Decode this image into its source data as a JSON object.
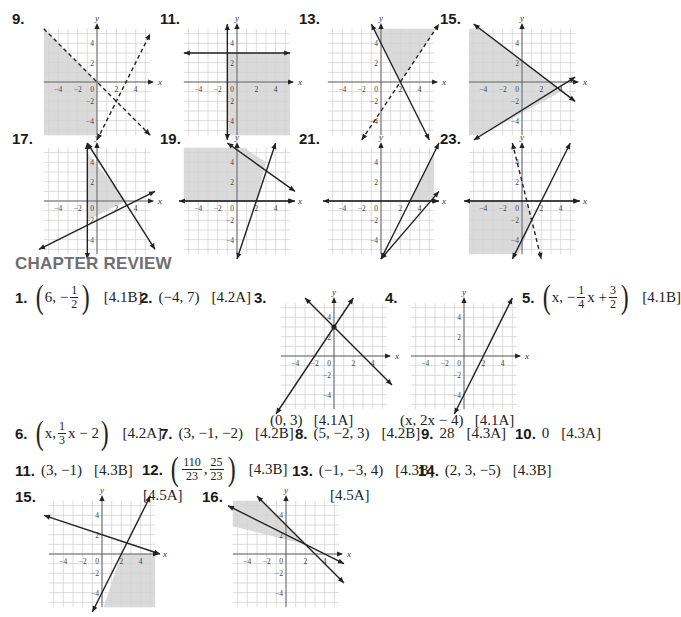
{
  "section_heading": "CHAPTER REVIEW",
  "colors": {
    "shade": "#d4d4d4",
    "grid": "#cfcfcf",
    "axis": "#555555",
    "line": "#222222",
    "heading": "#6d6f72"
  },
  "graphs_top": [
    {
      "id": "9",
      "label": "9.",
      "xlab": "x",
      "ylab": "y",
      "lines": [
        {
          "p1": [
            -5.5,
            5.5
          ],
          "p2": [
            5.5,
            -5.5
          ],
          "dashed": true,
          "arrows": [
            false,
            true
          ]
        },
        {
          "p1": [
            0,
            -6
          ],
          "p2": [
            5.5,
            5
          ],
          "dashed": true,
          "arrows": [
            true,
            true
          ]
        }
      ],
      "shade": [
        [
          -5.5,
          5.5
        ],
        [
          0,
          0
        ],
        [
          0,
          -6
        ],
        [
          -5.5,
          -6
        ]
      ]
    },
    {
      "id": "11",
      "label": "11.",
      "xlab": "x",
      "ylab": "y",
      "lines": [
        {
          "p1": [
            -5.5,
            3
          ],
          "p2": [
            5.5,
            3
          ],
          "dashed": false,
          "arrows": [
            true,
            true
          ]
        },
        {
          "p1": [
            -1,
            -6
          ],
          "p2": [
            -1,
            6
          ],
          "dashed": false,
          "arrows": [
            true,
            true
          ]
        }
      ],
      "shade": [
        [
          -1,
          3
        ],
        [
          5.5,
          3
        ],
        [
          5.5,
          -6
        ],
        [
          -1,
          -6
        ]
      ]
    },
    {
      "id": "13",
      "label": "13.",
      "xlab": "x",
      "ylab": "y",
      "lines": [
        {
          "p1": [
            -1,
            6
          ],
          "p2": [
            5,
            -6
          ],
          "dashed": false,
          "arrows": [
            true,
            true
          ]
        },
        {
          "p1": [
            -2,
            -6
          ],
          "p2": [
            6,
            6
          ],
          "dashed": true,
          "arrows": [
            true,
            true
          ]
        }
      ],
      "shade": [
        [
          -1,
          6
        ],
        [
          6,
          6
        ],
        [
          2,
          0
        ]
      ]
    },
    {
      "id": "15",
      "label": "15.",
      "xlab": "x",
      "ylab": "y",
      "lines": [
        {
          "p1": [
            -5,
            6
          ],
          "p2": [
            5.5,
            -2
          ],
          "dashed": false,
          "arrows": [
            true,
            true
          ]
        },
        {
          "p1": [
            -5,
            -6
          ],
          "p2": [
            5.5,
            0.5
          ],
          "dashed": false,
          "arrows": [
            true,
            true
          ]
        }
      ],
      "shade": [
        [
          -5.5,
          6
        ],
        [
          -5,
          6
        ],
        [
          4,
          -1
        ],
        [
          -5,
          -6
        ],
        [
          -5.5,
          -6
        ]
      ]
    },
    {
      "id": "17",
      "label": "17.",
      "xlab": "x",
      "ylab": "y",
      "lines": [
        {
          "p1": [
            -1,
            6
          ],
          "p2": [
            6,
            -5
          ],
          "dashed": false,
          "arrows": [
            true,
            true
          ]
        },
        {
          "p1": [
            -6,
            -5
          ],
          "p2": [
            6,
            1
          ],
          "dashed": false,
          "arrows": [
            true,
            true
          ]
        },
        {
          "p1": [
            -1,
            -6
          ],
          "p2": [
            -1,
            6
          ],
          "dashed": false,
          "arrows": [
            true,
            true
          ]
        }
      ],
      "shade": [
        [
          -1,
          5
        ],
        [
          3,
          0
        ],
        [
          -1,
          -2
        ]
      ]
    },
    {
      "id": "19",
      "label": "19.",
      "xlab": "x",
      "ylab": "y",
      "lines": [
        {
          "p1": [
            -1,
            6
          ],
          "p2": [
            6,
            1
          ],
          "dashed": false,
          "arrows": [
            true,
            true
          ]
        },
        {
          "p1": [
            0,
            -6
          ],
          "p2": [
            4,
            6
          ],
          "dashed": false,
          "arrows": [
            true,
            true
          ]
        },
        {
          "p1": [
            -6,
            0
          ],
          "p2": [
            6,
            0
          ],
          "dashed": false,
          "arrows": [
            true,
            true
          ]
        }
      ],
      "shade": [
        [
          -6,
          6
        ],
        [
          0,
          6
        ],
        [
          3,
          4
        ],
        [
          2,
          0
        ],
        [
          -6,
          0
        ]
      ]
    },
    {
      "id": "21",
      "label": "21.",
      "xlab": "x",
      "ylab": "y",
      "lines": [
        {
          "p1": [
            0,
            -6
          ],
          "p2": [
            6,
            6
          ],
          "dashed": false,
          "arrows": [
            true,
            true
          ]
        },
        {
          "p1": [
            0,
            -6
          ],
          "p2": [
            6,
            1
          ],
          "dashed": false,
          "arrows": [
            true,
            true
          ]
        },
        {
          "p1": [
            -6,
            0
          ],
          "p2": [
            6,
            0
          ],
          "dashed": false,
          "arrows": [
            true,
            true
          ]
        }
      ],
      "shade": [
        [
          3,
          0
        ],
        [
          6,
          6
        ],
        [
          6,
          0
        ]
      ]
    },
    {
      "id": "23",
      "label": "23.",
      "xlab": "x",
      "ylab": "y",
      "lines": [
        {
          "p1": [
            -1,
            6
          ],
          "p2": [
            2,
            -6
          ],
          "dashed": true,
          "arrows": [
            true,
            true
          ]
        },
        {
          "p1": [
            -1,
            -6
          ],
          "p2": [
            5,
            6
          ],
          "dashed": false,
          "arrows": [
            true,
            true
          ]
        },
        {
          "p1": [
            -6,
            0
          ],
          "p2": [
            6,
            0
          ],
          "dashed": false,
          "arrows": [
            true,
            true
          ]
        }
      ],
      "shade": [
        [
          -6,
          0
        ],
        [
          0.5,
          0
        ],
        [
          1,
          -2
        ],
        [
          -0.5,
          -6
        ],
        [
          -6,
          -6
        ]
      ]
    }
  ],
  "review": {
    "a1": {
      "n": "1.",
      "a": "6,",
      "frac": {
        "num": "1",
        "den": "2"
      },
      "neg": "−",
      "ref": "[4.1B]"
    },
    "a2": {
      "n": "2.",
      "text": "(−4, 7)",
      "ref": "[4.2A]"
    },
    "a3": {
      "n": "3.",
      "caption": "(0, 3)",
      "ref": "[4.1A]"
    },
    "a4": {
      "n": "4.",
      "caption": "(x, 2x − 4)",
      "ref": "[4.1A]"
    },
    "a5": {
      "n": "5.",
      "pre": "x, −",
      "frac1": {
        "num": "1",
        "den": "4"
      },
      "mid": "x +",
      "frac2": {
        "num": "3",
        "den": "2"
      },
      "ref": "[4.1B]"
    },
    "a6": {
      "n": "6.",
      "pre": "x,",
      "frac": {
        "num": "1",
        "den": "3"
      },
      "post": "x − 2",
      "ref": "[4.2A]"
    },
    "a7": {
      "n": "7.",
      "text": "(3, −1, −2)",
      "ref": "[4.2B]"
    },
    "a8": {
      "n": "8.",
      "text": "(5, −2, 3)",
      "ref": "[4.2B]"
    },
    "a9": {
      "n": "9.",
      "text": "28",
      "ref": "[4.3A]"
    },
    "a10": {
      "n": "10.",
      "text": "0",
      "ref": "[4.3A]"
    },
    "a11": {
      "n": "11.",
      "text": "(3, −1)",
      "ref": "[4.3B]"
    },
    "a12": {
      "n": "12.",
      "frac1": {
        "num": "110",
        "den": "23"
      },
      "frac2": {
        "num": "25",
        "den": "23"
      },
      "ref": "[4.3B]"
    },
    "a13": {
      "n": "13.",
      "text": "(−1, −3, 4)",
      "ref": "[4.3B]"
    },
    "a14": {
      "n": "14.",
      "text": "(2, 3, −5)",
      "ref": "[4.3B]"
    },
    "a15": {
      "n": "15.",
      "ref": "[4.5A]"
    },
    "a16": {
      "n": "16.",
      "ref": "[4.5A]"
    }
  },
  "graphs_review": [
    {
      "id": "r3",
      "xlab": "x",
      "ylab": "y",
      "lines": [
        {
          "p1": [
            -3,
            6
          ],
          "p2": [
            6,
            -3
          ],
          "dashed": false,
          "arrows": [
            true,
            true
          ]
        },
        {
          "p1": [
            -6,
            -6
          ],
          "p2": [
            2,
            6
          ],
          "dashed": false,
          "arrows": [
            true,
            true
          ]
        }
      ],
      "shade": [],
      "point": [
        0,
        3
      ]
    },
    {
      "id": "r4",
      "xlab": "x",
      "ylab": "y",
      "lines": [
        {
          "p1": [
            -1,
            -6
          ],
          "p2": [
            5,
            6
          ],
          "dashed": false,
          "arrows": [
            true,
            true
          ]
        }
      ],
      "shade": []
    },
    {
      "id": "r15",
      "xlab": "x",
      "ylab": "y",
      "lines": [
        {
          "p1": [
            -6,
            4
          ],
          "p2": [
            6,
            0
          ],
          "dashed": false,
          "arrows": [
            true,
            true
          ]
        },
        {
          "p1": [
            -1,
            -6
          ],
          "p2": [
            5,
            6
          ],
          "dashed": false,
          "arrows": [
            true,
            true
          ]
        }
      ],
      "shade": [
        [
          2,
          0
        ],
        [
          6,
          0
        ],
        [
          6,
          -6
        ],
        [
          0,
          -6
        ]
      ]
    },
    {
      "id": "r16",
      "xlab": "x",
      "ylab": "y",
      "lines": [
        {
          "p1": [
            -6,
            5
          ],
          "p2": [
            6,
            -1
          ],
          "dashed": false,
          "arrows": [
            true,
            true
          ]
        },
        {
          "p1": [
            -3,
            6
          ],
          "p2": [
            6,
            -3
          ],
          "dashed": false,
          "arrows": [
            true,
            true
          ]
        }
      ],
      "shade": [
        [
          -6,
          6
        ],
        [
          -3,
          6
        ],
        [
          2,
          1
        ],
        [
          -6,
          3
        ]
      ]
    }
  ]
}
